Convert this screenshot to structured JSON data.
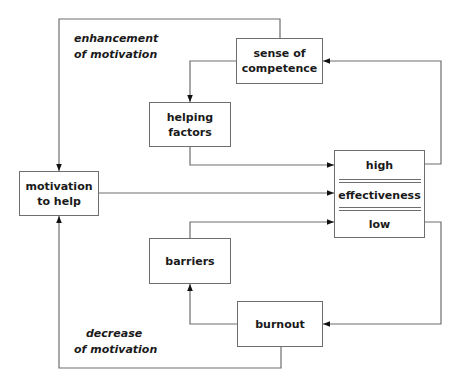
{
  "boxes": {
    "sense_of_competence": {
      "line1": "sense of",
      "line2": "competence"
    },
    "helping_factors": {
      "line1": "helping",
      "line2": "factors"
    },
    "motivation_to_help": {
      "line1": "motivation",
      "line2": "to help"
    },
    "effectiveness": {
      "high": "high",
      "middle": "effectiveness",
      "low": "low"
    },
    "barriers": {
      "line1": "barriers"
    },
    "burnout": {
      "line1": "burnout"
    }
  },
  "labels": {
    "enhancement": {
      "line1": "enhancement",
      "line2": "of motivation"
    },
    "decrease": {
      "line1": "decrease",
      "line2": "of motivation"
    }
  },
  "colors": {
    "line": "#6e6e6e",
    "text": "#1a1a1a",
    "arrow": "#111111"
  }
}
